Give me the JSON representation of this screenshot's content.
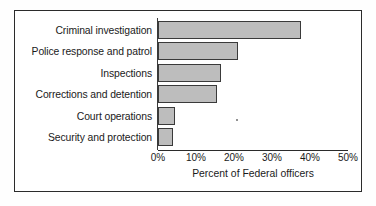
{
  "chart_data": {
    "type": "bar",
    "orientation": "horizontal",
    "title": "",
    "xlabel": "Percent of Federal officers",
    "ylabel": "",
    "categories": [
      "Criminal investigation",
      "Police response and patrol",
      "Inspections",
      "Corrections and detention",
      "Court operations",
      "Security and protection"
    ],
    "values": [
      37.5,
      21,
      16.5,
      15.5,
      4.5,
      4
    ],
    "xlim": [
      0,
      50
    ],
    "xticks": [
      0,
      10,
      20,
      30,
      40,
      50
    ],
    "xtick_labels": [
      "0%",
      "10%",
      "20%",
      "30%",
      "40%",
      "50%"
    ],
    "grid": false,
    "legend": null,
    "bar_fill_color": "#bdbdbd",
    "bar_edge_color": "#3a3a3a",
    "axis_color": "#2b2b2b",
    "frame_color": "#2b2b2b",
    "background_color": "#ffffff"
  },
  "figure": {
    "border_label": "chart-frame",
    "artifact_label": "scan-speck"
  }
}
